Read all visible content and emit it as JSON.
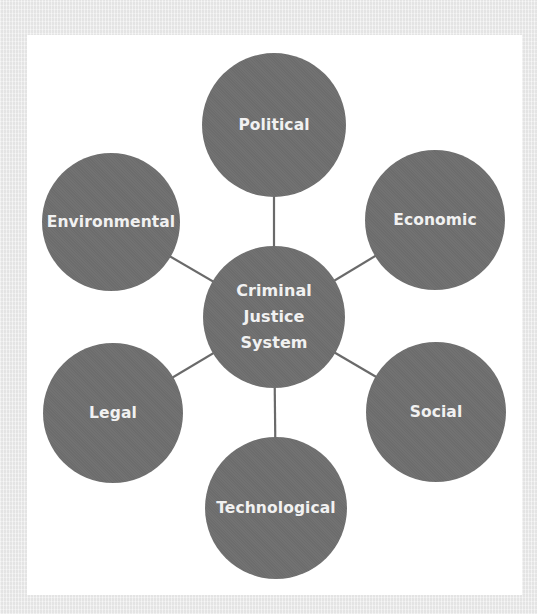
{
  "diagram": {
    "type": "hub-and-spoke",
    "colors": {
      "page_background": "#ededed",
      "panel_background": "#ffffff",
      "node_fill": "#6f6f6f",
      "node_text": "#f1f1f1",
      "connector": "#6a6a6a"
    },
    "center": {
      "label": "Criminal\nJustice\nSystem",
      "cx": 274,
      "cy": 317,
      "r": 71
    },
    "nodes": [
      {
        "id": "political",
        "label": "Political",
        "cx": 274,
        "cy": 125,
        "r": 72
      },
      {
        "id": "economic",
        "label": "Economic",
        "cx": 435,
        "cy": 220,
        "r": 70
      },
      {
        "id": "social",
        "label": "Social",
        "cx": 436,
        "cy": 412,
        "r": 70
      },
      {
        "id": "technological",
        "label": "Technological",
        "cx": 276,
        "cy": 508,
        "r": 71
      },
      {
        "id": "legal",
        "label": "Legal",
        "cx": 113,
        "cy": 413,
        "r": 70
      },
      {
        "id": "environmental",
        "label": "Environmental",
        "cx": 111,
        "cy": 222,
        "r": 69
      }
    ]
  }
}
